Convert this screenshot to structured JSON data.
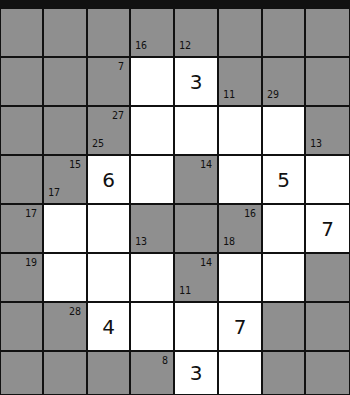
{
  "puzzle": {
    "type": "kakuro",
    "cols": 8,
    "rows": 8,
    "col_edges": [
      0,
      43,
      87,
      130,
      174,
      218,
      262,
      305,
      350
    ],
    "row_edges": [
      0,
      49,
      98,
      147,
      196,
      245,
      294,
      343,
      387
    ],
    "colors": {
      "block": "#8f8f8f",
      "white": "#ffffff",
      "line": "#111111"
    },
    "grid": [
      [
        {
          "t": "b"
        },
        {
          "t": "b"
        },
        {
          "t": "b"
        },
        {
          "t": "b",
          "down": "16"
        },
        {
          "t": "b",
          "down": "12"
        },
        {
          "t": "b"
        },
        {
          "t": "b"
        },
        {
          "t": "b"
        }
      ],
      [
        {
          "t": "b"
        },
        {
          "t": "b"
        },
        {
          "t": "b",
          "across": "7"
        },
        {
          "t": "w",
          "v": ""
        },
        {
          "t": "w",
          "v": "3"
        },
        {
          "t": "b",
          "down": "11"
        },
        {
          "t": "b",
          "down": "29"
        },
        {
          "t": "b"
        }
      ],
      [
        {
          "t": "b"
        },
        {
          "t": "b"
        },
        {
          "t": "b",
          "across": "27",
          "down": "25"
        },
        {
          "t": "w",
          "v": ""
        },
        {
          "t": "w",
          "v": ""
        },
        {
          "t": "w",
          "v": ""
        },
        {
          "t": "w",
          "v": ""
        },
        {
          "t": "b",
          "down": "13"
        }
      ],
      [
        {
          "t": "b"
        },
        {
          "t": "b",
          "across": "15",
          "down": "17"
        },
        {
          "t": "w",
          "v": "6"
        },
        {
          "t": "w",
          "v": ""
        },
        {
          "t": "b",
          "across": "14"
        },
        {
          "t": "w",
          "v": ""
        },
        {
          "t": "w",
          "v": "5"
        },
        {
          "t": "w",
          "v": ""
        }
      ],
      [
        {
          "t": "b",
          "across": "17"
        },
        {
          "t": "w",
          "v": ""
        },
        {
          "t": "w",
          "v": ""
        },
        {
          "t": "b",
          "down": "13"
        },
        {
          "t": "b"
        },
        {
          "t": "b",
          "across": "16",
          "down": "18"
        },
        {
          "t": "w",
          "v": ""
        },
        {
          "t": "w",
          "v": "7"
        }
      ],
      [
        {
          "t": "b",
          "across": "19"
        },
        {
          "t": "w",
          "v": ""
        },
        {
          "t": "w",
          "v": ""
        },
        {
          "t": "w",
          "v": ""
        },
        {
          "t": "b",
          "across": "14",
          "down": "11"
        },
        {
          "t": "w",
          "v": ""
        },
        {
          "t": "w",
          "v": ""
        },
        {
          "t": "b"
        }
      ],
      [
        {
          "t": "b"
        },
        {
          "t": "b",
          "across": "28"
        },
        {
          "t": "w",
          "v": "4"
        },
        {
          "t": "w",
          "v": ""
        },
        {
          "t": "w",
          "v": ""
        },
        {
          "t": "w",
          "v": "7"
        },
        {
          "t": "b"
        },
        {
          "t": "b"
        }
      ],
      [
        {
          "t": "b"
        },
        {
          "t": "b"
        },
        {
          "t": "b"
        },
        {
          "t": "b",
          "across": "8"
        },
        {
          "t": "w",
          "v": "3"
        },
        {
          "t": "w",
          "v": ""
        },
        {
          "t": "b"
        },
        {
          "t": "b"
        }
      ]
    ]
  }
}
